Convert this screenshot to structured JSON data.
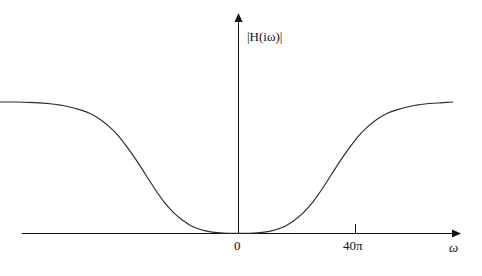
{
  "figure": {
    "kind": "line-plot",
    "background_color": "#ffffff",
    "line_color": "#2a2a2a",
    "axis_color": "#111111"
  },
  "axes": {
    "y_axis_label": "|H(iω)|",
    "y_axis_label_parts": {
      "open_bar": "|",
      "h_symbol": "H",
      "argument": "(iω)",
      "close_bar": "|"
    },
    "x_axis_label": "ω",
    "x_ticks": [
      {
        "label": "0",
        "value": 0,
        "has_mark": false
      },
      {
        "label": "40π",
        "value": 125.66,
        "has_mark": true
      }
    ],
    "y_ticks": []
  },
  "chart_data": {
    "type": "line",
    "title": "",
    "subtitle": "",
    "xlabel": "ω",
    "ylabel": "|H(iω)|",
    "xlim": [
      -260,
      230
    ],
    "ylim": [
      0,
      1.12
    ],
    "grid": false,
    "legend": null,
    "annotations": [
      {
        "text": "0",
        "x": 0,
        "y": 0,
        "placement": "below-axis"
      },
      {
        "text": "40π",
        "x": 125.66,
        "y": 0,
        "placement": "below-axis"
      },
      {
        "text": "ω",
        "x": 228,
        "y": 0,
        "placement": "axis-end"
      },
      {
        "text": "|H(iω)|",
        "x": 0,
        "y": 1.0,
        "placement": "y-axis-top"
      }
    ],
    "series": [
      {
        "name": "|H(iω)|",
        "x": [
          -260,
          -240,
          -220,
          -200,
          -190,
          -180,
          -170,
          -160,
          -150,
          -140,
          -130,
          -120,
          -110,
          -100,
          -90,
          -80,
          -70,
          -60,
          -50,
          -40,
          -30,
          -20,
          -10,
          0,
          10,
          20,
          30,
          40,
          50,
          60,
          70,
          80,
          90,
          100,
          110,
          120,
          130,
          140,
          150,
          160,
          170,
          180,
          190,
          200,
          220,
          230
        ],
        "y": [
          1.0,
          1.0,
          0.995,
          0.985,
          0.975,
          0.96,
          0.94,
          0.915,
          0.875,
          0.82,
          0.75,
          0.66,
          0.56,
          0.45,
          0.34,
          0.24,
          0.16,
          0.1,
          0.055,
          0.028,
          0.012,
          0.004,
          0.001,
          0.0,
          0.001,
          0.004,
          0.012,
          0.028,
          0.055,
          0.1,
          0.16,
          0.24,
          0.34,
          0.45,
          0.56,
          0.66,
          0.75,
          0.82,
          0.875,
          0.915,
          0.94,
          0.96,
          0.975,
          0.985,
          0.995,
          1.0
        ]
      }
    ]
  }
}
